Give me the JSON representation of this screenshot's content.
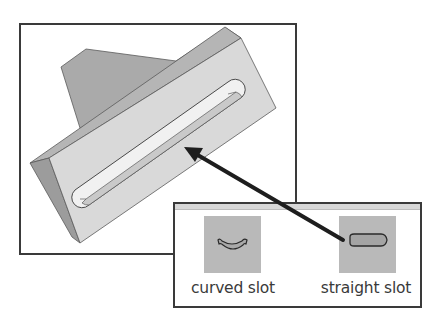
{
  "figure": {
    "colors": {
      "frame_border": "#3a3a3a",
      "part_back_face": "#aaaaaa",
      "part_front_face": "#d9d9d9",
      "part_side_face": "#9c9c9c",
      "part_top_face": "#b5b5b5",
      "slot_floor": "#f1f1f1",
      "slot_wall": "#c9c9c9",
      "icon_tile": "#b9b9b9",
      "arrow": "#1e1e1e"
    }
  },
  "palette": {
    "items": [
      {
        "id": "curved",
        "label": "curved slot",
        "icon": "curved-slot-icon"
      },
      {
        "id": "straight",
        "label": "straight slot",
        "icon": "straight-slot-icon"
      }
    ]
  },
  "callout": {
    "from": "straight slot",
    "to": "slot feature on part"
  }
}
